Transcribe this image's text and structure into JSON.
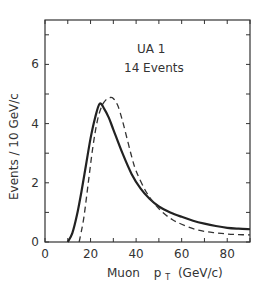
{
  "chart_data": {
    "type": "line",
    "title": "",
    "annotations": [
      "UA 1",
      "14 Events"
    ],
    "xlabel": "Muon  p_T (GeV/c)",
    "xlabel_main": "Muon",
    "xlabel_var": "p",
    "xlabel_sub": "T",
    "xlabel_unit": "(GeV/c)",
    "ylabel": "Events / 10 GeV/c",
    "xlim": [
      0,
      90
    ],
    "ylim": [
      0,
      7.5
    ],
    "xticks": [
      0,
      20,
      40,
      60,
      80
    ],
    "yticks": [
      0,
      2,
      4,
      6
    ],
    "grid": false,
    "legend": "none",
    "series": [
      {
        "name": "solid",
        "style": "solid",
        "x": [
          10,
          12,
          14,
          16,
          18,
          20,
          22,
          24,
          26,
          28,
          30,
          34,
          38,
          42,
          46,
          50,
          55,
          60,
          65,
          70,
          75,
          80,
          85,
          90
        ],
        "y": [
          0,
          0.3,
          0.9,
          1.7,
          2.6,
          3.5,
          4.2,
          4.67,
          4.5,
          4.2,
          3.8,
          3.0,
          2.3,
          1.8,
          1.45,
          1.2,
          1.0,
          0.85,
          0.72,
          0.62,
          0.54,
          0.48,
          0.45,
          0.43
        ]
      },
      {
        "name": "dashed",
        "style": "dashed",
        "x": [
          15,
          17,
          19,
          21,
          23,
          25,
          27,
          28.5,
          30,
          32,
          34,
          36,
          38,
          40,
          44,
          48,
          52,
          56,
          60,
          65,
          70,
          75,
          80,
          85,
          90
        ],
        "y": [
          0,
          0.8,
          2.0,
          3.2,
          4.1,
          4.6,
          4.82,
          4.88,
          4.85,
          4.6,
          4.1,
          3.5,
          2.9,
          2.4,
          1.75,
          1.3,
          0.98,
          0.75,
          0.6,
          0.45,
          0.36,
          0.31,
          0.27,
          0.25,
          0.24
        ]
      }
    ]
  }
}
